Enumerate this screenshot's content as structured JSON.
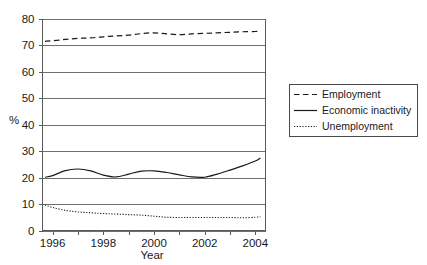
{
  "chart_data": {
    "type": "line",
    "title": "",
    "xlabel": "Year",
    "ylabel": "%",
    "xlim": [
      1995.6,
      2004.4
    ],
    "ylim": [
      0,
      80
    ],
    "grid": true,
    "legend_position": "right",
    "yticks": [
      0,
      10,
      20,
      30,
      40,
      50,
      60,
      70,
      80
    ],
    "ytick_labels": [
      "0",
      "10",
      "20",
      "30",
      "40",
      "50",
      "60",
      "70",
      "80"
    ],
    "xticks": [
      1996,
      1997,
      1998,
      1999,
      2000,
      2001,
      2002,
      2003,
      2004
    ],
    "xtick_labels": [
      "1996",
      "",
      "1998",
      "",
      "2000",
      "",
      "2002",
      "",
      "2004"
    ],
    "x": [
      1995.7,
      1996,
      1996.5,
      1997,
      1997.5,
      1998,
      1998.5,
      1999,
      1999.5,
      2000,
      2000.5,
      2001,
      2001.5,
      2002,
      2002.5,
      2003,
      2003.5,
      2004,
      2004.2
    ],
    "series": [
      {
        "name": "Employment",
        "style": "dashed",
        "values": [
          71.4,
          71.6,
          72.1,
          72.5,
          72.7,
          73.1,
          73.4,
          73.7,
          74.3,
          74.6,
          74.2,
          73.9,
          74.2,
          74.4,
          74.6,
          74.8,
          75.0,
          75.1,
          75.2
        ]
      },
      {
        "name": "Economic inactivity",
        "style": "solid",
        "values": [
          20.1,
          20.7,
          22.6,
          23.2,
          22.5,
          20.9,
          20.2,
          21.3,
          22.4,
          22.5,
          21.9,
          21.0,
          20.2,
          20.1,
          21.3,
          22.8,
          24.4,
          26.2,
          27.4
        ]
      },
      {
        "name": "Unemployment",
        "style": "dotted",
        "values": [
          9.6,
          8.7,
          7.6,
          7.0,
          6.7,
          6.4,
          6.2,
          6.0,
          5.8,
          5.4,
          5.0,
          4.9,
          4.9,
          4.9,
          4.9,
          4.9,
          4.8,
          5.0,
          5.2
        ]
      }
    ],
    "legend_entries": [
      {
        "label": "Employment",
        "style": "dashed"
      },
      {
        "label": "Economic inactivity",
        "style": "solid"
      },
      {
        "label": "Unemployment",
        "style": "dotted"
      }
    ],
    "colors": {
      "line": "#1a1a1a",
      "grid": "#6e6e6e",
      "frame": "#5a5a5a",
      "background": "#ffffff"
    }
  }
}
